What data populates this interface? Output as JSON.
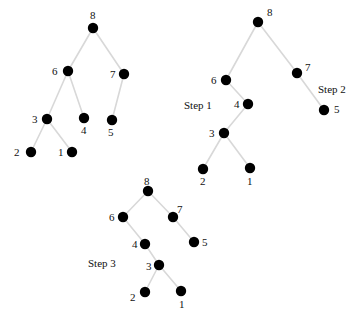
{
  "figure": {
    "width": 363,
    "height": 322,
    "background": "#ffffff",
    "node_color": "#000000",
    "edge_color": "#d8d8d8",
    "label_color": "#111111",
    "node_radius": 5.2,
    "edge_width": 1.6
  },
  "chart_data": {
    "type": "diagram",
    "subtitle": "",
    "xlabel": "",
    "ylabel": "",
    "trees": [
      {
        "name": "tree-initial",
        "step_label": "",
        "nodes": [
          {
            "key": "8",
            "x": 93,
            "y": 28,
            "label_x": 90,
            "label_y": 10,
            "label_pos": "above"
          },
          {
            "key": "6",
            "x": 68,
            "y": 71,
            "label_x": 52,
            "label_y": 66,
            "label_pos": "left"
          },
          {
            "key": "7",
            "x": 124,
            "y": 74,
            "label_x": 110,
            "label_y": 69,
            "label_pos": "left"
          },
          {
            "key": "3",
            "x": 47,
            "y": 119,
            "label_x": 32,
            "label_y": 114,
            "label_pos": "left"
          },
          {
            "key": "4",
            "x": 84,
            "y": 118,
            "label_x": 81,
            "label_y": 125,
            "label_pos": "below"
          },
          {
            "key": "5",
            "x": 112,
            "y": 120,
            "label_x": 108,
            "label_y": 127,
            "label_pos": "below"
          },
          {
            "key": "2",
            "x": 31,
            "y": 152,
            "label_x": 14,
            "label_y": 147,
            "label_pos": "left"
          },
          {
            "key": "1",
            "x": 72,
            "y": 152,
            "label_x": 58,
            "label_y": 147,
            "label_pos": "left"
          }
        ],
        "edges": [
          {
            "from": "8",
            "to": "6"
          },
          {
            "from": "8",
            "to": "7"
          },
          {
            "from": "6",
            "to": "3"
          },
          {
            "from": "6",
            "to": "4"
          },
          {
            "from": "7",
            "to": "5"
          },
          {
            "from": "3",
            "to": "2"
          },
          {
            "from": "3",
            "to": "1"
          }
        ]
      },
      {
        "name": "tree-step-1-2",
        "step_label": "",
        "nodes": [
          {
            "key": "8",
            "x": 258,
            "y": 22,
            "label_x": 267,
            "label_y": 7,
            "label_pos": "above-right"
          },
          {
            "key": "6",
            "x": 226,
            "y": 80,
            "label_x": 211,
            "label_y": 75,
            "label_pos": "left"
          },
          {
            "key": "7",
            "x": 297,
            "y": 73,
            "label_x": 305,
            "label_y": 62,
            "label_pos": "above-right"
          },
          {
            "key": "4",
            "x": 248,
            "y": 104,
            "label_x": 234,
            "label_y": 99,
            "label_pos": "left"
          },
          {
            "key": "5",
            "x": 324,
            "y": 110,
            "label_x": 334,
            "label_y": 104,
            "label_pos": "right"
          },
          {
            "key": "3",
            "x": 224,
            "y": 133,
            "label_x": 209,
            "label_y": 128,
            "label_pos": "left"
          },
          {
            "key": "2",
            "x": 203,
            "y": 169,
            "label_x": 200,
            "label_y": 176,
            "label_pos": "below"
          },
          {
            "key": "1",
            "x": 250,
            "y": 168,
            "label_x": 247,
            "label_y": 176,
            "label_pos": "below"
          }
        ],
        "edges": [
          {
            "from": "8",
            "to": "6"
          },
          {
            "from": "8",
            "to": "7"
          },
          {
            "from": "6",
            "to": "4"
          },
          {
            "from": "7",
            "to": "5"
          },
          {
            "from": "4",
            "to": "3"
          },
          {
            "from": "3",
            "to": "2"
          },
          {
            "from": "3",
            "to": "1"
          }
        ]
      },
      {
        "name": "tree-step-3",
        "step_label": "",
        "nodes": [
          {
            "key": "8",
            "x": 148,
            "y": 191,
            "label_x": 144,
            "label_y": 176,
            "label_pos": "above"
          },
          {
            "key": "6",
            "x": 123,
            "y": 217,
            "label_x": 109,
            "label_y": 212,
            "label_pos": "left"
          },
          {
            "key": "7",
            "x": 173,
            "y": 217,
            "label_x": 177,
            "label_y": 204,
            "label_pos": "above-right"
          },
          {
            "key": "4",
            "x": 145,
            "y": 244,
            "label_x": 132,
            "label_y": 239,
            "label_pos": "left"
          },
          {
            "key": "5",
            "x": 194,
            "y": 242,
            "label_x": 202,
            "label_y": 237,
            "label_pos": "right"
          },
          {
            "key": "3",
            "x": 159,
            "y": 265,
            "label_x": 146,
            "label_y": 261,
            "label_pos": "left"
          },
          {
            "key": "2",
            "x": 145,
            "y": 292,
            "label_x": 130,
            "label_y": 292,
            "label_pos": "left"
          },
          {
            "key": "1",
            "x": 181,
            "y": 291,
            "label_x": 179,
            "label_y": 299,
            "label_pos": "below"
          }
        ],
        "edges": [
          {
            "from": "8",
            "to": "6"
          },
          {
            "from": "8",
            "to": "7"
          },
          {
            "from": "6",
            "to": "4"
          },
          {
            "from": "7",
            "to": "5"
          },
          {
            "from": "4",
            "to": "3"
          },
          {
            "from": "3",
            "to": "2"
          },
          {
            "from": "3",
            "to": "1"
          }
        ]
      }
    ],
    "annotations": [
      {
        "name": "step-1-label",
        "text": "Step 1",
        "x": 184,
        "y": 100
      },
      {
        "name": "step-2-label",
        "text": "Step 2",
        "x": 318,
        "y": 84
      },
      {
        "name": "step-3-label",
        "text": "Step 3",
        "x": 88,
        "y": 258
      }
    ]
  }
}
